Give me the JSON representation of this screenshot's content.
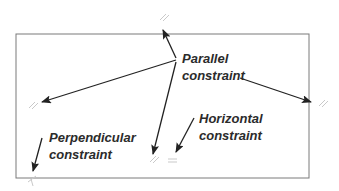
{
  "labels": {
    "parallel": [
      "Parallel",
      "constraint"
    ],
    "horizontal": [
      "Horizontal",
      "constraint"
    ],
    "perpendicular": [
      "Perpendicular",
      "constraint"
    ]
  },
  "symbols": {
    "parallel": "//",
    "horizontal": "="
  },
  "colors": {
    "outline": "#7a7a7a",
    "arrow": "#222222",
    "text": "#2b2b2b",
    "constraint_mark": "#c9c9c9"
  }
}
